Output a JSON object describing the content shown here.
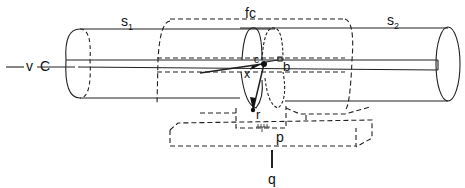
{
  "diagram": {
    "labels": {
      "s1": {
        "base": "s",
        "sub": "1"
      },
      "s2": {
        "base": "s",
        "sub": "2"
      },
      "fc": "fc",
      "v": "v",
      "c_left": "C",
      "c_mid": "c",
      "x": "x",
      "b": "b",
      "r": "r",
      "p": "p",
      "q": "q"
    },
    "colors": {
      "line": "#222222",
      "background": "#ffffff"
    }
  }
}
